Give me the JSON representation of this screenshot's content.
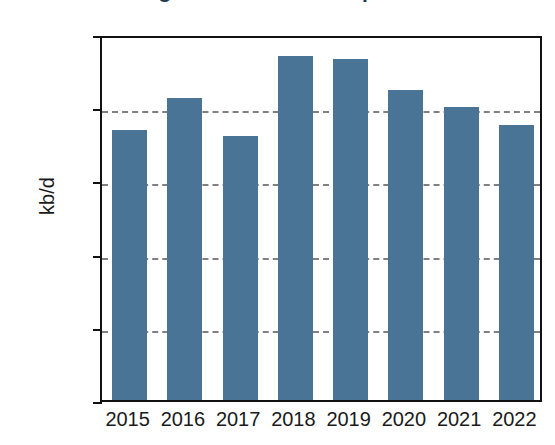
{
  "chart_data": {
    "type": "bar",
    "title": "Figure 3. Crude Oil Imports",
    "xlabel": "",
    "ylabel": "kb/d",
    "categories": [
      "2015",
      "2016",
      "2017",
      "2018",
      "2019",
      "2020",
      "2021",
      "2022"
    ],
    "values": [
      972,
      1015,
      963,
      1073,
      1069,
      1026,
      1003,
      978
    ],
    "series": [
      {
        "name": "kb/d",
        "values": [
          972,
          1015,
          963,
          1073,
          1069,
          1026,
          1003,
          978
        ]
      }
    ],
    "ylim": [
      600,
      1100
    ],
    "yticks": [
      "1100",
      "1000",
      "900",
      "800",
      "700",
      "600"
    ],
    "ytick_values": [
      1100,
      1000,
      900,
      800,
      700,
      600
    ],
    "grid": "horizontal-dashed",
    "legend": "none",
    "bar_color": "#4a7496",
    "gridline_color": "#808080",
    "axis_color": "#111111"
  }
}
